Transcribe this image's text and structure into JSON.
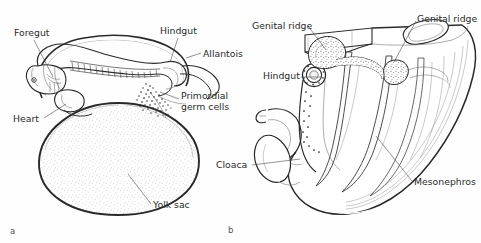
{
  "figure": {
    "title": "",
    "background_color": "#fefefe",
    "ink_color": "#2a2a2a",
    "panels": [
      {
        "id": "a",
        "letter": "a",
        "caption": "",
        "labels": [
          {
            "name": "foregut",
            "text": "Foregut"
          },
          {
            "name": "hindgut",
            "text": "Hindgut"
          },
          {
            "name": "allantois",
            "text": "Allantois"
          },
          {
            "name": "primordial-germ-cells-line1",
            "text": "Primordial"
          },
          {
            "name": "primordial-germ-cells-line2",
            "text": "germ cells"
          },
          {
            "name": "heart",
            "text": "Heart"
          },
          {
            "name": "yolk-sac",
            "text": "Yolk sac"
          }
        ]
      },
      {
        "id": "b",
        "letter": "b",
        "caption": "",
        "labels": [
          {
            "name": "genital-ridge-left",
            "text": "Genital ridge"
          },
          {
            "name": "genital-ridge-right",
            "text": "Genital ridge"
          },
          {
            "name": "hindgut",
            "text": "Hindgut"
          },
          {
            "name": "cloaca",
            "text": "Cloaca"
          },
          {
            "name": "mesonephros",
            "text": "Mesonephros"
          }
        ]
      }
    ]
  },
  "panel_a": {
    "letter": "a",
    "label_foregut": "Foregut",
    "label_hindgut": "Hindgut",
    "label_allantois": "Allantois",
    "label_germ1": "Primordial",
    "label_germ2": "germ cells",
    "label_heart": "Heart",
    "label_yolk_sac": "Yolk sac"
  },
  "panel_b": {
    "letter": "b",
    "label_genital_ridge_left": "Genital ridge",
    "label_genital_ridge_right": "Genital ridge",
    "label_hindgut": "Hindgut",
    "label_cloaca": "Cloaca",
    "label_mesonephros": "Mesonephros"
  }
}
